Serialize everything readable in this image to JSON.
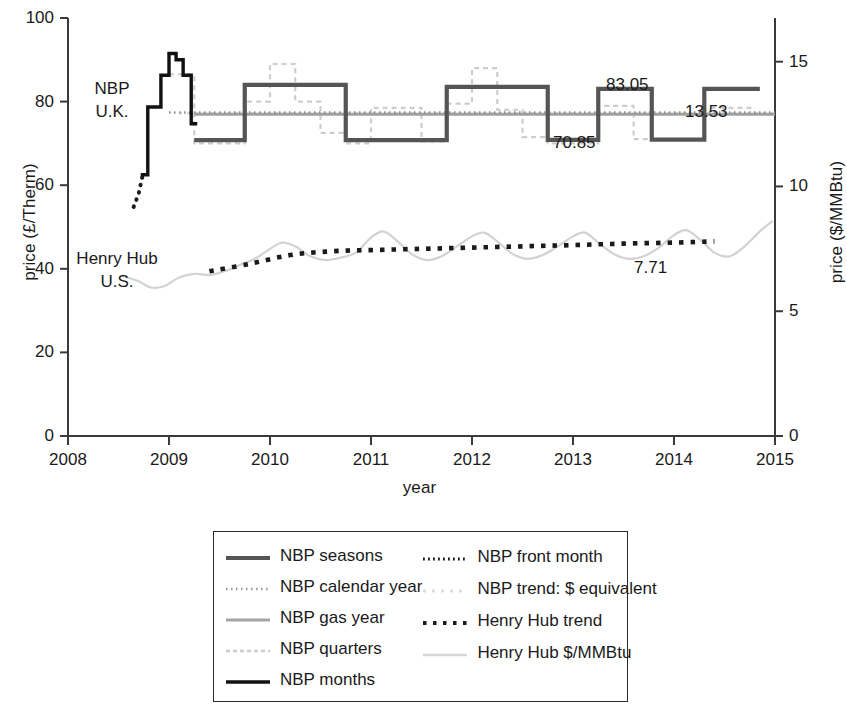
{
  "chart_data": {
    "type": "line",
    "title": "",
    "xlabel": "year",
    "ylabel_left": "price (£/Therm)",
    "ylabel_right": "price ($/MMBtu)",
    "xlim": [
      2008,
      2015
    ],
    "ylim_left": [
      0,
      100
    ],
    "ylim_right": [
      0,
      16.75
    ],
    "grid": false,
    "legend_position": "below-plot",
    "x_ticks": [
      "2008",
      "2009",
      "2010",
      "2011",
      "2012",
      "2013",
      "2014",
      "2015"
    ],
    "y_ticks_left": [
      "0",
      "20",
      "40",
      "60",
      "80",
      "100"
    ],
    "y_ticks_right": [
      "0",
      "5",
      "10",
      "15"
    ],
    "annotations": [
      {
        "text": "NBP\nU.K.",
        "line1": "NBP",
        "line2": "U.K.",
        "x": 2008.3,
        "y": 82
      },
      {
        "text": "Henry Hub\nU.S.",
        "line1": "Henry Hub",
        "line2": "U.S.",
        "x": 2008.35,
        "y": 45
      },
      {
        "text": "83.05",
        "x": 2013.55,
        "y": 84.5
      },
      {
        "text": "13.53",
        "x": 2014.1,
        "y": 78
      },
      {
        "text": "70.85",
        "x": 2013.0,
        "y": 68.5
      },
      {
        "text": "7.71",
        "x": 2013.5,
        "y": 40.5
      }
    ],
    "series": [
      {
        "name": "NBP seasons",
        "style": "solid-thick",
        "color": "#555555",
        "units": "£/Therm",
        "points": [
          [
            2009.25,
            70.8
          ],
          [
            2009.75,
            70.8
          ],
          [
            2009.75,
            84.0
          ],
          [
            2010.75,
            84.0
          ],
          [
            2010.75,
            70.8
          ],
          [
            2011.75,
            70.8
          ],
          [
            2011.75,
            83.5
          ],
          [
            2012.75,
            83.5
          ],
          [
            2012.75,
            70.85
          ],
          [
            2013.25,
            70.85
          ],
          [
            2013.25,
            83.05
          ],
          [
            2013.78,
            83.05
          ],
          [
            2013.78,
            70.9
          ],
          [
            2014.3,
            70.9
          ],
          [
            2014.3,
            83.05
          ],
          [
            2014.85,
            83.05
          ]
        ]
      },
      {
        "name": "NBP calendar year",
        "style": "dotted-fine",
        "color": "#8a8a8a",
        "units": "£/Therm",
        "points": [
          [
            2009.0,
            77.4
          ],
          [
            2015.0,
            77.4
          ]
        ]
      },
      {
        "name": "NBP gas year",
        "style": "solid-thin-gray",
        "color": "#999999",
        "units": "£/Therm",
        "points": [
          [
            2009.25,
            77.0
          ],
          [
            2015.0,
            77.0
          ]
        ]
      },
      {
        "name": "NBP quarters",
        "style": "dashed-light",
        "color": "#c7c7c7",
        "units": "£/Therm",
        "points": [
          [
            2009.0,
            86.5
          ],
          [
            2009.25,
            86.5
          ],
          [
            2009.25,
            70.0
          ],
          [
            2009.75,
            70.0
          ],
          [
            2009.75,
            80.0
          ],
          [
            2010.0,
            80.0
          ],
          [
            2010.0,
            89.0
          ],
          [
            2010.25,
            89.0
          ],
          [
            2010.25,
            80.0
          ],
          [
            2010.5,
            80.0
          ],
          [
            2010.5,
            72.5
          ],
          [
            2010.75,
            72.5
          ],
          [
            2010.75,
            70.0
          ],
          [
            2011.0,
            70.0
          ],
          [
            2011.0,
            78.5
          ],
          [
            2011.5,
            78.5
          ],
          [
            2011.5,
            70.5
          ],
          [
            2011.75,
            70.5
          ],
          [
            2011.75,
            79.5
          ],
          [
            2012.0,
            79.5
          ],
          [
            2012.0,
            88.0
          ],
          [
            2012.25,
            88.0
          ],
          [
            2012.25,
            78.0
          ],
          [
            2012.5,
            78.0
          ],
          [
            2012.5,
            71.5
          ],
          [
            2012.75,
            71.5
          ],
          [
            2012.75,
            70.0
          ],
          [
            2013.25,
            70.0
          ],
          [
            2013.25,
            79.0
          ],
          [
            2013.6,
            79.0
          ],
          [
            2013.6,
            71.0
          ],
          [
            2014.3,
            71.0
          ],
          [
            2014.3,
            78.5
          ],
          [
            2014.8,
            78.5
          ]
        ]
      },
      {
        "name": "NBP months",
        "style": "solid-black",
        "color": "#111111",
        "units": "£/Therm",
        "points": [
          [
            2008.72,
            62.5
          ],
          [
            2008.79,
            62.5
          ],
          [
            2008.79,
            78.7
          ],
          [
            2008.92,
            78.7
          ],
          [
            2008.92,
            86.3
          ],
          [
            2009.0,
            86.3
          ],
          [
            2009.0,
            91.5
          ],
          [
            2009.07,
            91.5
          ],
          [
            2009.07,
            90.0
          ],
          [
            2009.14,
            90.0
          ],
          [
            2009.14,
            86.3
          ],
          [
            2009.22,
            86.3
          ],
          [
            2009.22,
            74.7
          ],
          [
            2009.28,
            74.7
          ]
        ]
      },
      {
        "name": "NBP front month",
        "style": "dotted-black",
        "color": "#1a1a1a",
        "units": "£/Therm",
        "points": [
          [
            2008.65,
            54.8
          ],
          [
            2008.7,
            58.0
          ],
          [
            2008.74,
            62.5
          ]
        ]
      },
      {
        "name": "NBP trend: $ equivalent",
        "style": "dotted-verylight",
        "color": "#d8d8d8",
        "units": "£/Therm",
        "points": [
          [
            2009.1,
            77.2
          ],
          [
            2015.0,
            77.2
          ]
        ]
      },
      {
        "name": "Henry Hub trend",
        "style": "dotted-square-black",
        "color": "#1a1a1a",
        "units": "$/MMBtu",
        "points": [
          [
            2009.4,
            6.6
          ],
          [
            2009.8,
            6.9
          ],
          [
            2010.2,
            7.25
          ],
          [
            2010.6,
            7.4
          ],
          [
            2011.0,
            7.45
          ],
          [
            2011.5,
            7.5
          ],
          [
            2012.0,
            7.55
          ],
          [
            2012.5,
            7.6
          ],
          [
            2013.0,
            7.65
          ],
          [
            2013.5,
            7.71
          ],
          [
            2014.0,
            7.75
          ],
          [
            2014.4,
            7.8
          ]
        ]
      },
      {
        "name": "Henry Hub $/MMBtu",
        "style": "wavy-light",
        "color": "#d0d0d0",
        "units": "$/MMBtu",
        "points": [
          [
            2008.55,
            6.4
          ],
          [
            2008.7,
            6.2
          ],
          [
            2008.82,
            5.95
          ],
          [
            2008.95,
            6.0
          ],
          [
            2009.1,
            6.35
          ],
          [
            2009.25,
            6.5
          ],
          [
            2009.4,
            6.45
          ],
          [
            2009.55,
            6.6
          ],
          [
            2009.7,
            6.85
          ],
          [
            2009.85,
            7.1
          ],
          [
            2010.0,
            7.5
          ],
          [
            2010.12,
            7.75
          ],
          [
            2010.25,
            7.6
          ],
          [
            2010.4,
            7.2
          ],
          [
            2010.55,
            7.05
          ],
          [
            2010.7,
            7.15
          ],
          [
            2010.85,
            7.35
          ],
          [
            2011.0,
            7.95
          ],
          [
            2011.12,
            8.2
          ],
          [
            2011.25,
            7.85
          ],
          [
            2011.4,
            7.3
          ],
          [
            2011.55,
            7.05
          ],
          [
            2011.7,
            7.2
          ],
          [
            2011.85,
            7.6
          ],
          [
            2012.0,
            8.0
          ],
          [
            2012.12,
            8.15
          ],
          [
            2012.25,
            7.8
          ],
          [
            2012.4,
            7.3
          ],
          [
            2012.55,
            7.1
          ],
          [
            2012.7,
            7.25
          ],
          [
            2012.85,
            7.6
          ],
          [
            2013.0,
            8.0
          ],
          [
            2013.12,
            8.15
          ],
          [
            2013.25,
            7.75
          ],
          [
            2013.4,
            7.3
          ],
          [
            2013.55,
            7.1
          ],
          [
            2013.7,
            7.2
          ],
          [
            2013.85,
            7.55
          ],
          [
            2014.0,
            8.05
          ],
          [
            2014.12,
            8.25
          ],
          [
            2014.25,
            7.9
          ],
          [
            2014.4,
            7.35
          ],
          [
            2014.55,
            7.2
          ],
          [
            2014.7,
            7.6
          ],
          [
            2014.85,
            8.2
          ],
          [
            2014.97,
            8.6
          ]
        ]
      }
    ]
  },
  "axes": {
    "x_ticks": [
      {
        "label": "2008",
        "value": 2008
      },
      {
        "label": "2009",
        "value": 2009
      },
      {
        "label": "2010",
        "value": 2010
      },
      {
        "label": "2011",
        "value": 2011
      },
      {
        "label": "2012",
        "value": 2012
      },
      {
        "label": "2013",
        "value": 2013
      },
      {
        "label": "2014",
        "value": 2014
      },
      {
        "label": "2015",
        "value": 2015
      }
    ],
    "y_left_ticks": [
      {
        "label": "100",
        "value": 100
      },
      {
        "label": "80",
        "value": 80
      },
      {
        "label": "60",
        "value": 60
      },
      {
        "label": "40",
        "value": 40
      },
      {
        "label": "20",
        "value": 20
      },
      {
        "label": "0",
        "value": 0
      }
    ],
    "y_right_ticks": [
      {
        "label": "15",
        "value": 15
      },
      {
        "label": "10",
        "value": 10
      },
      {
        "label": "5",
        "value": 5
      },
      {
        "label": "0",
        "value": 0
      }
    ],
    "x_title": "year",
    "y_left_title": "price (£/Therm)",
    "y_right_title": "price ($/MMBtu)"
  },
  "plot_annotations": {
    "nbp_label_line1": "NBP",
    "nbp_label_line2": "U.K.",
    "hh_label_line1": "Henry Hub",
    "hh_label_line2": "U.S.",
    "value_83_05": "83.05",
    "value_13_53": "13.53",
    "value_70_85": "70.85",
    "value_7_71": "7.71"
  },
  "legend": {
    "column_left": [
      {
        "label": "NBP seasons",
        "swatch": "solid-thick-gray"
      },
      {
        "label": "NBP calendar year",
        "swatch": "dotted-fine-gray"
      },
      {
        "label": "NBP gas year",
        "swatch": "solid-thin-gray"
      },
      {
        "label": "NBP quarters",
        "swatch": "dashed-light-gray"
      },
      {
        "label": "NBP months",
        "swatch": "solid-black"
      }
    ],
    "column_right": [
      {
        "label": "NBP front month",
        "swatch": "dotted-black-fine"
      },
      {
        "label": "NBP trend: $ equivalent",
        "swatch": "dotted-verylight"
      },
      {
        "label": "Henry Hub trend",
        "swatch": "dotted-square-black"
      },
      {
        "label": "Henry Hub $/MMBtu",
        "swatch": "wavy-light"
      }
    ]
  }
}
